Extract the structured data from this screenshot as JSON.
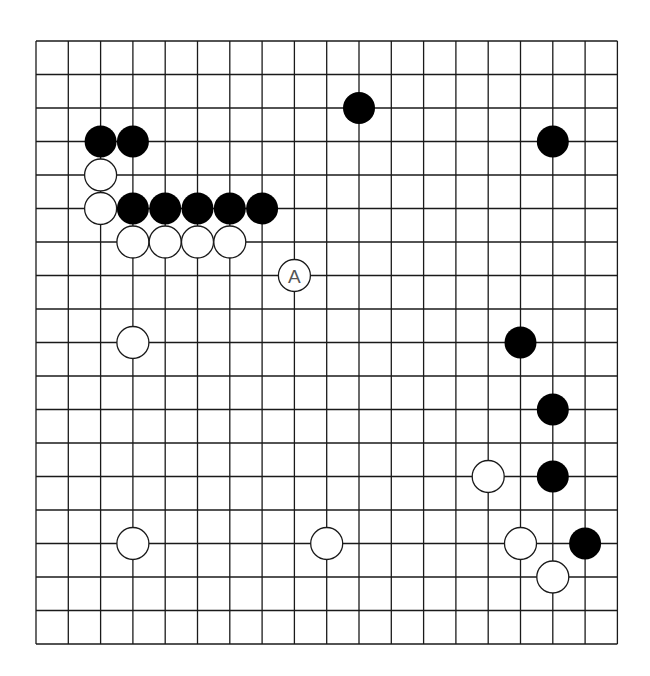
{
  "board": {
    "size": 19,
    "origin_x": 36,
    "origin_y": 41,
    "spacing_x": 32.3,
    "spacing_y": 33.5,
    "stone_radius": 16,
    "line_color": "#1a1a1a",
    "background": "#ffffff"
  },
  "stones": [
    {
      "color": "black",
      "col": 2,
      "row": 3
    },
    {
      "color": "black",
      "col": 3,
      "row": 3
    },
    {
      "color": "white",
      "col": 2,
      "row": 4
    },
    {
      "color": "white",
      "col": 2,
      "row": 5
    },
    {
      "color": "black",
      "col": 3,
      "row": 5
    },
    {
      "color": "black",
      "col": 4,
      "row": 5
    },
    {
      "color": "black",
      "col": 5,
      "row": 5
    },
    {
      "color": "black",
      "col": 6,
      "row": 5
    },
    {
      "color": "black",
      "col": 7,
      "row": 5
    },
    {
      "color": "white",
      "col": 3,
      "row": 6
    },
    {
      "color": "white",
      "col": 4,
      "row": 6
    },
    {
      "color": "white",
      "col": 5,
      "row": 6
    },
    {
      "color": "white",
      "col": 6,
      "row": 6
    },
    {
      "color": "white",
      "col": 8,
      "row": 7,
      "label": "A"
    },
    {
      "color": "black",
      "col": 10,
      "row": 2
    },
    {
      "color": "black",
      "col": 16,
      "row": 3
    },
    {
      "color": "white",
      "col": 3,
      "row": 9
    },
    {
      "color": "black",
      "col": 15,
      "row": 9
    },
    {
      "color": "black",
      "col": 16,
      "row": 11
    },
    {
      "color": "white",
      "col": 14,
      "row": 13
    },
    {
      "color": "black",
      "col": 16,
      "row": 13
    },
    {
      "color": "white",
      "col": 3,
      "row": 15
    },
    {
      "color": "white",
      "col": 9,
      "row": 15
    },
    {
      "color": "white",
      "col": 15,
      "row": 15
    },
    {
      "color": "black",
      "col": 17,
      "row": 15
    },
    {
      "color": "white",
      "col": 16,
      "row": 16
    }
  ],
  "annotations": {
    "A": {
      "col": 8,
      "row": 7,
      "text": "A",
      "on_stone": "white"
    }
  }
}
